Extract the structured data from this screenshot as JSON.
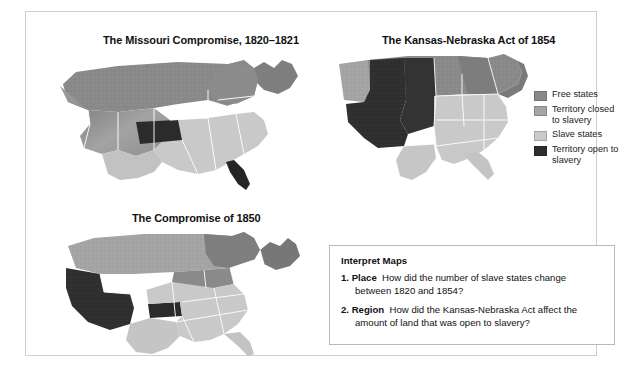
{
  "figure": {
    "maps": [
      {
        "id": "missouri",
        "title": "The Missouri Compromise, 1820–1821"
      },
      {
        "id": "kansas",
        "title": "The Kansas-Nebraska Act of 1854"
      },
      {
        "id": "compromise",
        "title": "The Compromise of 1850"
      }
    ]
  },
  "legend": {
    "items": [
      {
        "label": "Free states",
        "color": "#8a8a8a",
        "icon": "legend-swatch-free-states"
      },
      {
        "label": "Territory closed to slavery",
        "color": "#a5a5a5",
        "icon": "legend-swatch-territory-closed"
      },
      {
        "label": "Slave states",
        "color": "#c9c9c9",
        "icon": "legend-swatch-slave-states"
      },
      {
        "label": "Territory open to slavery",
        "color": "#2e2e2e",
        "icon": "legend-swatch-territory-open"
      }
    ]
  },
  "interpret": {
    "heading": "Interpret Maps",
    "questions": [
      {
        "number": "1.",
        "term": "Place",
        "text": "How did the number of slave states change between 1820 and 1854?"
      },
      {
        "number": "2.",
        "term": "Region",
        "text": "How did the Kansas-Nebraska Act affect the amount of land that was open to slavery?"
      }
    ]
  },
  "colors": {
    "free_states": "#8a8a8a",
    "territory_closed": "#a5a5a5",
    "slave_states": "#c9c9c9",
    "territory_open": "#2e2e2e",
    "border_line": "#ffffff",
    "frame": "#cfcfcf"
  }
}
